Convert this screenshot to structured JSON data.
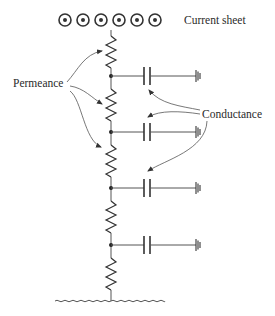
{
  "labels": {
    "current_sheet": "Current sheet",
    "permeance": "Permeance",
    "conductance": "Conductance"
  },
  "current_sheet": {
    "symbol": "dot-in-circle (current out of page)",
    "count": 6
  },
  "ladder": {
    "resistor_count": 5,
    "branch_count": 4,
    "branch_element": "capacitor to ground",
    "bottom_terminal": "wavy ground line"
  },
  "annotations": {
    "permeance_arrows": 3,
    "conductance_arrows": 3
  },
  "colors": {
    "line": "#333333",
    "text": "#2a2a2a",
    "background": "#ffffff"
  }
}
